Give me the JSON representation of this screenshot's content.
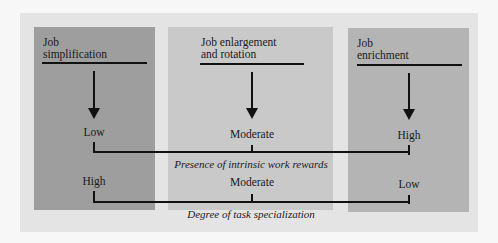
{
  "diagram": {
    "columns": [
      {
        "title_line1": "Job",
        "title_line2": "simplification",
        "color": "#9e9e9e"
      },
      {
        "title_line1": "Job enlargement",
        "title_line2": "and rotation",
        "color": "#c9c9c9"
      },
      {
        "title_line1": "Job",
        "title_line2": "enrichment",
        "color": "#b4b4b4"
      }
    ],
    "dimensions": [
      {
        "label": "Presence of intrinsic work rewards",
        "values": [
          "Low",
          "Moderate",
          "High"
        ]
      },
      {
        "label": "Degree of task specialization",
        "values": [
          "High",
          "Moderate",
          "Low"
        ]
      }
    ],
    "colors": {
      "background": "#f7f7f7",
      "panel": "#e4e4e4",
      "lines": "#111111"
    }
  }
}
